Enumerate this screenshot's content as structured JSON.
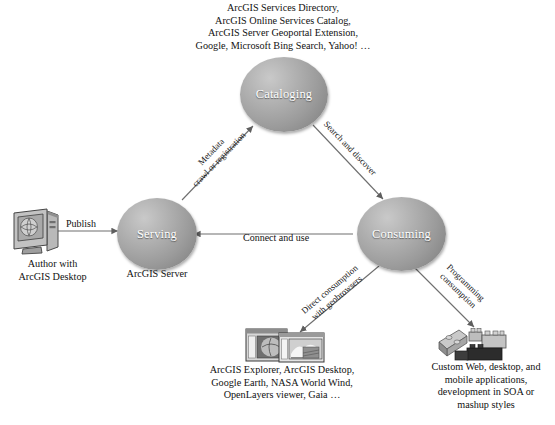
{
  "diagram": {
    "accent_color": "#9b9b9b",
    "line_color": "#6e6e6e",
    "text_color": "#1a1a1a"
  },
  "nodes": [
    {
      "id": "cataloging",
      "label": "Cataloging"
    },
    {
      "id": "serving",
      "label": "Serving"
    },
    {
      "id": "consuming",
      "label": "Consuming"
    }
  ],
  "edges": [
    {
      "id": "publish",
      "label": "Publish"
    },
    {
      "id": "connect-and-use",
      "label": "Connect and use"
    },
    {
      "id": "metadata-crawl",
      "line1": "Metadata",
      "line2": "crawl or registration"
    },
    {
      "id": "search-and-discover",
      "line1": "Search and discover",
      "line2": ""
    },
    {
      "id": "direct-consumption",
      "line1": "Direct consumption",
      "line2": "with geobrowsers"
    },
    {
      "id": "programming",
      "line1": "Programming",
      "line2": "consumption"
    }
  ],
  "captions": {
    "cataloging_top": [
      "ArcGIS Services Directory,",
      "ArcGIS Online Services Catalog,",
      "ArcGIS Server Geoportal Extension,",
      "Google, Microsoft Bing Search, Yahoo! …"
    ],
    "author_desktop": [
      "Author with",
      "ArcGIS Desktop"
    ],
    "arcgis_server": [
      "ArcGIS Server"
    ],
    "geobrowsers": [
      "ArcGIS Explorer,  ArcGIS Desktop,",
      "Google Earth, NASA World Wind,",
      "OpenLayers viewer, Gaia …"
    ],
    "custom_apps": [
      "Custom Web, desktop, and",
      "mobile applications,",
      "development in SOA or",
      "mashup styles"
    ]
  },
  "icons": {
    "author": "desktop-computer-icon",
    "geobrowser": "map-windows-icon",
    "custom_apps": "building-blocks-icon"
  }
}
